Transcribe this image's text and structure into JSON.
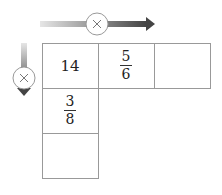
{
  "diagram": {
    "operation": "multiply",
    "row_operator_icon": "times-circle-icon",
    "column_operator_icon": "times-circle-icon",
    "grid": [
      [
        {
          "value": "14"
        },
        {
          "numerator": "5",
          "denominator": "6"
        },
        {
          "value": ""
        }
      ],
      [
        {
          "numerator": "3",
          "denominator": "8"
        },
        null,
        null
      ],
      [
        {
          "value": ""
        },
        null,
        null
      ]
    ]
  }
}
